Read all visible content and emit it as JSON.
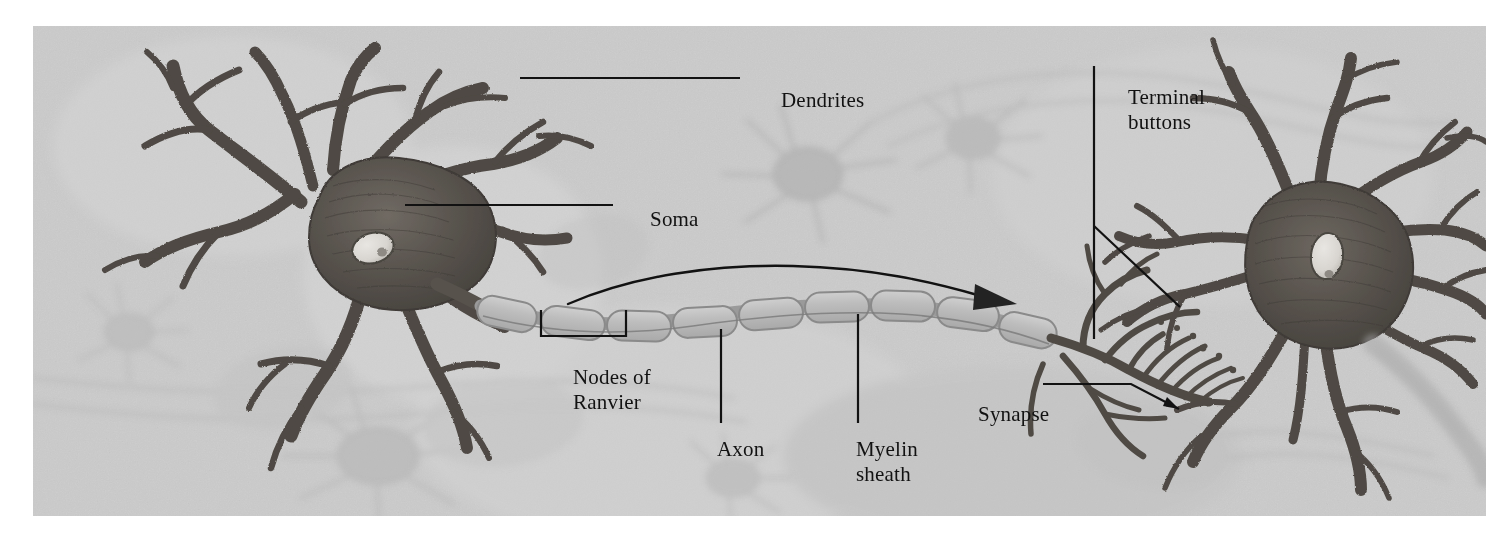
{
  "figure": {
    "plate": {
      "background_color": "#c9c9c9",
      "page_color": "#ffffff",
      "ink_color": "#121212",
      "cell_color": "#4c4945",
      "ghost_color": "#b4b4b4"
    }
  },
  "labels": {
    "dendrites": "Dendrites",
    "soma": "Soma",
    "terminal_buttons_line1": "Terminal",
    "terminal_buttons_line2": "buttons",
    "nodes_of_ranvier_line1": "Nodes of",
    "nodes_of_ranvier_line2": "Ranvier",
    "axon": "Axon",
    "myelin_sheath_line1": "Myelin",
    "myelin_sheath_line2": "sheath",
    "synapse": "Synapse"
  },
  "annotations": {
    "direction_arrow": "signal-direction-arrow",
    "dendrites_leader": "horizontal-leader-line",
    "soma_leader": "horizontal-leader-line",
    "terminal_leader": "vertical-and-diagonal-leader-lines",
    "nodes_leader": "bracket-leader",
    "axon_leader": "vertical-leader-line",
    "myelin_leader": "vertical-leader-line",
    "synapse_leader": "elbow-leader-with-arrow"
  },
  "structures": {
    "presynaptic_neuron": "left neuron with soma, nucleus and dendrites",
    "postsynaptic_neuron": "right neuron with soma, nucleus and dendrites",
    "myelinated_axon": "axon wrapped in myelin segments separated by nodes of Ranvier",
    "axon_terminals": "branching terminal arborization contacting right neuron",
    "background_neurons": "faint ghosted neurons and fibers in background"
  }
}
